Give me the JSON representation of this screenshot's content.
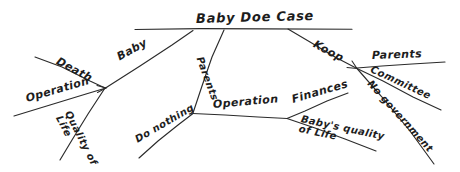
{
  "diagram": {
    "kind": "hand-drawn-fishbone-decision-diagram",
    "title": "Baby Doe Case",
    "ink_color": "#2b2b2b",
    "background_color": "#ffffff",
    "nodes": [
      {
        "id": "spine-left-end",
        "x": 135,
        "y": 29
      },
      {
        "id": "spine-right-end",
        "x": 352,
        "y": 29
      },
      {
        "id": "junction-left",
        "x": 105,
        "y": 88
      },
      {
        "id": "junction-lower-mid",
        "x": 193,
        "y": 113
      },
      {
        "id": "junction-lower-right",
        "x": 287,
        "y": 118
      },
      {
        "id": "junction-right",
        "x": 357,
        "y": 68
      }
    ],
    "labels": [
      {
        "id": "title",
        "text": "Baby Doe Case",
        "x": 196,
        "y": 12,
        "rotate": -1.5,
        "size": 13
      },
      {
        "id": "death",
        "text": "Death",
        "x": 57,
        "y": 55,
        "rotate": 28,
        "size": 11
      },
      {
        "id": "baby",
        "text": "Baby",
        "x": 118,
        "y": 52,
        "rotate": -29,
        "size": 11
      },
      {
        "id": "operation-left",
        "text": "Operation",
        "x": 26,
        "y": 93,
        "rotate": -16,
        "size": 11
      },
      {
        "id": "quality-of-life",
        "text": "Quality of\nLife",
        "x": 63,
        "y": 104,
        "rotate": 63,
        "size": 10
      },
      {
        "id": "parents-stem",
        "text": "Parents",
        "x": 199,
        "y": 52,
        "rotate": 70,
        "size": 10
      },
      {
        "id": "do-nothing",
        "text": "Do nothing",
        "x": 136,
        "y": 135,
        "rotate": -30,
        "size": 10
      },
      {
        "id": "operation-mid",
        "text": "Operation",
        "x": 213,
        "y": 99,
        "rotate": -5,
        "size": 11
      },
      {
        "id": "finances",
        "text": "Finances",
        "x": 292,
        "y": 94,
        "rotate": -16,
        "size": 11
      },
      {
        "id": "babys-quality",
        "text": "Baby's quality\nof Life",
        "x": 300,
        "y": 114,
        "rotate": 12,
        "size": 10
      },
      {
        "id": "koop",
        "text": "Koop",
        "x": 314,
        "y": 38,
        "rotate": 28,
        "size": 11
      },
      {
        "id": "parents-right",
        "text": "Parents",
        "x": 372,
        "y": 50,
        "rotate": -2,
        "size": 11
      },
      {
        "id": "committee",
        "text": "Committee",
        "x": 371,
        "y": 64,
        "rotate": 25,
        "size": 10
      },
      {
        "id": "no-government",
        "text": "No government",
        "x": 369,
        "y": 77,
        "rotate": 48,
        "size": 10
      }
    ],
    "edges": [
      {
        "id": "spine",
        "label_ref": "title",
        "from": "spine-left-end",
        "to": "spine-right-end"
      },
      {
        "id": "baby-branch",
        "label_ref": "baby",
        "from": "junction-left",
        "to": "spine-left-end"
      },
      {
        "id": "death-branch",
        "label_ref": "death",
        "from": "death-tip",
        "to": "junction-left"
      },
      {
        "id": "operation-left-branch",
        "label_ref": "operation-left",
        "from": "operation-left-tip",
        "to": "junction-left"
      },
      {
        "id": "quality-branch",
        "label_ref": "quality-of-life",
        "from": "junction-left",
        "to": "quality-tip"
      },
      {
        "id": "parents-branch",
        "label_ref": "parents-stem",
        "from": "junction-lower-mid",
        "to": "parents-top"
      },
      {
        "id": "do-nothing-branch",
        "label_ref": "do-nothing",
        "from": "do-nothing-tip",
        "to": "junction-lower-mid"
      },
      {
        "id": "operation-mid-branch",
        "label_ref": "operation-mid",
        "from": "junction-lower-mid",
        "to": "junction-lower-right"
      },
      {
        "id": "finances-branch",
        "label_ref": "finances",
        "from": "finances-tip",
        "to": "junction-lower-right"
      },
      {
        "id": "babys-quality-branch",
        "label_ref": "babys-quality",
        "from": "junction-lower-right",
        "to": "babys-quality-tip"
      },
      {
        "id": "koop-branch",
        "label_ref": "koop",
        "from": "spine-koop-origin",
        "to": "junction-right"
      },
      {
        "id": "parents-right-branch",
        "label_ref": "parents-right",
        "from": "parents-right-tip",
        "to": "junction-right"
      },
      {
        "id": "committee-branch",
        "label_ref": "committee",
        "from": "committee-tip",
        "to": "junction-right"
      },
      {
        "id": "no-government-branch",
        "label_ref": "no-government",
        "from": "no-government-tip",
        "to": "junction-right"
      }
    ]
  }
}
